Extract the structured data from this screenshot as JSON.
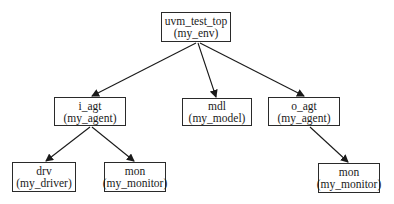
{
  "diagram": {
    "type": "tree",
    "nodes": [
      {
        "id": "top",
        "name": "uvm_test_top",
        "type": "(my_env)",
        "x": 161,
        "y": 12,
        "w": 70,
        "h": 30
      },
      {
        "id": "i_agt",
        "name": "i_agt",
        "type": "(my_agent)",
        "x": 54,
        "y": 97,
        "w": 72,
        "h": 29
      },
      {
        "id": "mdl",
        "name": "mdl",
        "type": "(my_model)",
        "x": 182,
        "y": 98,
        "w": 70,
        "h": 28
      },
      {
        "id": "o_agt",
        "name": "o_agt",
        "type": "(my_agent)",
        "x": 268,
        "y": 97,
        "w": 72,
        "h": 29
      },
      {
        "id": "drv",
        "name": "drv",
        "type": "(my_driver)",
        "x": 12,
        "y": 162,
        "w": 64,
        "h": 30
      },
      {
        "id": "mon_i",
        "name": "mon",
        "type": "(my_monitor)",
        "x": 104,
        "y": 162,
        "w": 62,
        "h": 30
      },
      {
        "id": "mon_o",
        "name": "mon",
        "type": "(my_monitor)",
        "x": 318,
        "y": 163,
        "w": 62,
        "h": 30
      }
    ],
    "edges": [
      {
        "from": "top",
        "to": "i_agt"
      },
      {
        "from": "top",
        "to": "mdl"
      },
      {
        "from": "top",
        "to": "o_agt"
      },
      {
        "from": "i_agt",
        "to": "drv"
      },
      {
        "from": "i_agt",
        "to": "mon_i"
      },
      {
        "from": "o_agt",
        "to": "mon_o"
      }
    ]
  }
}
